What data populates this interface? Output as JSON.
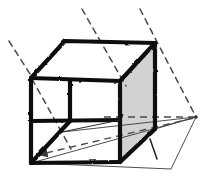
{
  "figure": {
    "kind": "geometry-diagram",
    "style": "hand-drawn-sketch",
    "canvas": {
      "width": 211,
      "height": 178
    },
    "colors": {
      "background": "#ffffff",
      "ink": "#111111",
      "shaded_face_fill": "#d2d2d2",
      "shaded_face_stroke": "#111111",
      "thin_line": "#3a3a3a",
      "dash": "#4a4a4a"
    },
    "labels": {
      "title": "",
      "annotations": []
    },
    "vertices": {
      "top_back_left": [
        65,
        41
      ],
      "top_back_right": [
        155,
        42
      ],
      "top_front_left": [
        30,
        78
      ],
      "top_front_right": [
        120,
        80
      ],
      "bottom_front_left": [
        30,
        163
      ],
      "bottom_front_right": [
        120,
        163
      ],
      "bottom_back_right": [
        155,
        130
      ],
      "hidden_back_left_top": [
        70,
        80
      ],
      "hidden_back_left_bottom": [
        70,
        120
      ],
      "vanishing_point_right": [
        196,
        117
      ]
    },
    "faces": [
      {
        "name": "top-face",
        "shaded": false,
        "outline": "thick"
      },
      {
        "name": "front-left-face",
        "shaded": false,
        "outline": "thick"
      },
      {
        "name": "right-face",
        "shaded": true,
        "outline": "thick",
        "fill": "#d2d2d2"
      },
      {
        "name": "bottom-face",
        "shaded": false,
        "outline": "thick"
      }
    ],
    "construction_lines": [
      {
        "name": "dash-upper-left",
        "from": [
          9,
          41
        ],
        "to": [
          31,
          77
        ],
        "style": "dashed"
      },
      {
        "name": "dash-top-middle",
        "from": [
          82,
          9
        ],
        "to": [
          125,
          84
        ],
        "style": "dashed"
      },
      {
        "name": "dash-top-right",
        "from": [
          141,
          9
        ],
        "to": [
          196,
          117
        ],
        "style": "dashed"
      },
      {
        "name": "dash-interior-left-vertical",
        "from": [
          31,
          78
        ],
        "to": [
          70,
          148
        ],
        "style": "dashed"
      },
      {
        "name": "dash-to-vanishing-mid",
        "from": [
          108,
          117
        ],
        "to": [
          196,
          117
        ],
        "style": "dashed"
      },
      {
        "name": "dash-to-vanishing-low",
        "from": [
          48,
          152
        ],
        "to": [
          196,
          117
        ],
        "style": "dashed",
        "arrow": "start"
      },
      {
        "name": "thin-edge-mid",
        "from": [
          62,
          132
        ],
        "to": [
          196,
          117
        ],
        "style": "solid-thin"
      },
      {
        "name": "thin-edge-low",
        "from": [
          31,
          163
        ],
        "to": [
          196,
          117
        ],
        "style": "solid-thin"
      },
      {
        "name": "thin-edge-bottom-right",
        "from": [
          31,
          163
        ],
        "to": [
          170,
          168
        ],
        "style": "solid-thin"
      },
      {
        "name": "thin-edge-vp-bottom",
        "from": [
          170,
          168
        ],
        "to": [
          196,
          117
        ],
        "style": "solid-thin"
      },
      {
        "name": "right-angle-tick",
        "from": [
          151,
          140
        ],
        "to": [
          156,
          158
        ],
        "style": "solid-thin"
      }
    ],
    "hidden_edges": [
      {
        "name": "hidden-vertical-back-left",
        "from": [
          70,
          80
        ],
        "to": [
          70,
          120
        ]
      }
    ]
  }
}
